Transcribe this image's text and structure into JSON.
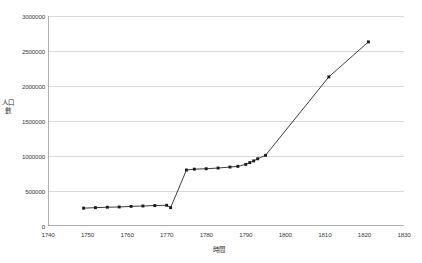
{
  "chart_data": {
    "type": "line",
    "title": "",
    "xlabel": "時間",
    "ylabel": "人口數",
    "xlim": [
      1740,
      1830
    ],
    "ylim": [
      0,
      3000000
    ],
    "xticks": [
      1740,
      1750,
      1760,
      1770,
      1780,
      1790,
      1800,
      1810,
      1820,
      1830
    ],
    "yticks": [
      0,
      500000,
      1000000,
      1500000,
      2000000,
      2500000,
      3000000
    ],
    "xtick_labels": [
      "1740",
      "1750",
      "1760",
      "1770",
      "1780",
      "1790",
      "1800",
      "1810",
      "1820",
      "1830"
    ],
    "ytick_labels": [
      "0",
      "500000",
      "1000000",
      "1500000",
      "2000000",
      "2500000",
      "3000000"
    ],
    "grid": "horizontal",
    "legend": "none",
    "marker": "filled-square",
    "line_color": "#1a1a1a",
    "grid_color": "#c9c9c9",
    "axis_color": "#9a9a9a",
    "series": [
      {
        "name": "人口數",
        "x": [
          1749,
          1752,
          1755,
          1758,
          1761,
          1764,
          1767,
          1770,
          1771,
          1775,
          1777,
          1780,
          1783,
          1786,
          1788,
          1790,
          1791,
          1792,
          1793,
          1795,
          1811,
          1821
        ],
        "values": [
          255000,
          262000,
          268000,
          272000,
          280000,
          286000,
          292000,
          296000,
          262000,
          800000,
          812000,
          818000,
          828000,
          842000,
          852000,
          880000,
          905000,
          930000,
          960000,
          1010000,
          2130000,
          2630000
        ]
      }
    ]
  }
}
